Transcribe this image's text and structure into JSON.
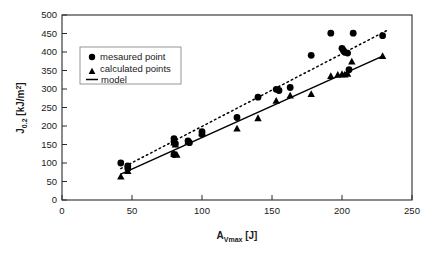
{
  "chart_data": {
    "type": "scatter",
    "title": "",
    "xlabel": "A_Vmax [J]",
    "ylabel": "J_0.2 [kJ/m^2]",
    "xlim": [
      0,
      250
    ],
    "ylim": [
      0,
      500
    ],
    "xticks": [
      0,
      50,
      100,
      150,
      200,
      250
    ],
    "yticks": [
      0,
      50,
      100,
      150,
      200,
      250,
      300,
      350,
      400,
      450,
      500
    ],
    "grid": false,
    "legend_position": "upper-left",
    "series": [
      {
        "name": "mesaured point",
        "marker": "circle",
        "points": [
          [
            42,
            100
          ],
          [
            47,
            92
          ],
          [
            47,
            85
          ],
          [
            80,
            166
          ],
          [
            80,
            158
          ],
          [
            81,
            152
          ],
          [
            80,
            123
          ],
          [
            90,
            160
          ],
          [
            91,
            155
          ],
          [
            100,
            185
          ],
          [
            100,
            178
          ],
          [
            125,
            223
          ],
          [
            140,
            278
          ],
          [
            153,
            299
          ],
          [
            155,
            296
          ],
          [
            163,
            304
          ],
          [
            178,
            391
          ],
          [
            192,
            451
          ],
          [
            200,
            410
          ],
          [
            201,
            404
          ],
          [
            202,
            399
          ],
          [
            204,
            397
          ],
          [
            205,
            352
          ],
          [
            208,
            451
          ],
          [
            229,
            444
          ]
        ]
      },
      {
        "name": "calculated points",
        "marker": "triangle",
        "points": [
          [
            42,
            63
          ],
          [
            47,
            78
          ],
          [
            80,
            155
          ],
          [
            81,
            150
          ],
          [
            80,
            124
          ],
          [
            82,
            122
          ],
          [
            90,
            158
          ],
          [
            100,
            180
          ],
          [
            125,
            193
          ],
          [
            140,
            221
          ],
          [
            153,
            268
          ],
          [
            163,
            282
          ],
          [
            178,
            286
          ],
          [
            192,
            335
          ],
          [
            197,
            338
          ],
          [
            200,
            340
          ],
          [
            202,
            339
          ],
          [
            204,
            341
          ],
          [
            207,
            374
          ],
          [
            229,
            389
          ]
        ]
      }
    ],
    "lines": [
      {
        "name": "model",
        "style": "solid",
        "x": [
          42,
          229
        ],
        "y": [
          70,
          389
        ]
      },
      {
        "name": "measured trend",
        "style": "dotted",
        "x": [
          42,
          232
        ],
        "y": [
          85,
          458
        ]
      }
    ],
    "legend_entries": [
      {
        "label": "mesaured point",
        "marker": "circle"
      },
      {
        "label": "calculated points",
        "marker": "triangle"
      },
      {
        "label": "model",
        "marker": "line"
      }
    ]
  },
  "axes": {
    "x_title_main": "A",
    "x_title_sub": "Vmax",
    "x_title_unit": " [J]",
    "y_title_main": "J",
    "y_title_sub": "0.2",
    "y_title_unit": " [kJ/m",
    "y_title_sup": "2",
    "y_title_close": "]",
    "x_tick_labels": [
      "0",
      "50",
      "100",
      "150",
      "200",
      "250"
    ],
    "y_tick_labels": [
      "0",
      "50",
      "100",
      "150",
      "200",
      "250",
      "300",
      "350",
      "400",
      "450",
      "500"
    ]
  },
  "colors": {
    "marker": "#000000",
    "frame": "#2b2b2b",
    "legend_border": "#8a8a8a",
    "background": "#ffffff",
    "text": "#1a1a1a"
  }
}
